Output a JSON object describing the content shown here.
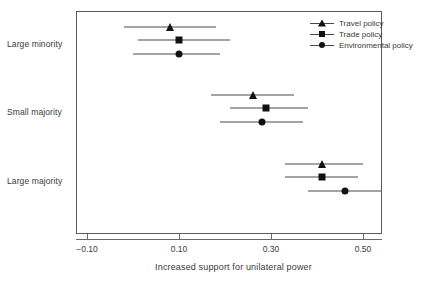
{
  "chart_data": {
    "type": "scatter",
    "subtype": "dot-and-whisker coefficient plot",
    "title": "",
    "xlabel": "Increased support for unilateral power",
    "ylabel": "",
    "xlim": [
      -0.155,
      0.511
    ],
    "xticks": [
      -0.1,
      0.1,
      0.3,
      0.5
    ],
    "xtick_labels": [
      "−0.10",
      "0.10",
      "0.30",
      "0.50"
    ],
    "categories": [
      "Large minority",
      "Small majority",
      "Large majority"
    ],
    "grid": false,
    "legend_position": "top-right",
    "error_bar_style": "horizontal confidence interval",
    "series": [
      {
        "name": "Travel policy",
        "marker": "triangle",
        "color": "#111111",
        "estimates": [
          0.08,
          0.26,
          0.41
        ],
        "ci_low": [
          -0.02,
          0.17,
          0.33
        ],
        "ci_high": [
          0.18,
          0.35,
          0.5
        ]
      },
      {
        "name": "Trade policy",
        "marker": "square",
        "color": "#111111",
        "estimates": [
          0.1,
          0.29,
          0.41
        ],
        "ci_low": [
          0.01,
          0.21,
          0.33
        ],
        "ci_high": [
          0.21,
          0.38,
          0.49
        ]
      },
      {
        "name": "Environmental policy",
        "marker": "circle",
        "color": "#111111",
        "estimates": [
          0.1,
          0.28,
          0.46
        ],
        "ci_low": [
          0.0,
          0.19,
          0.38
        ],
        "ci_high": [
          0.19,
          0.37,
          0.54
        ]
      }
    ]
  },
  "legend": {
    "items": [
      {
        "label": "Travel policy",
        "marker": "triangle"
      },
      {
        "label": "Trade policy",
        "marker": "square"
      },
      {
        "label": "Environmental policy",
        "marker": "circle"
      }
    ]
  },
  "axis": {
    "x_title": "Increased support for unilateral power",
    "tick_labels": [
      "−0.10",
      "0.10",
      "0.30",
      "0.50"
    ],
    "category_labels": [
      "Large minority",
      "Small majority",
      "Large majority"
    ]
  }
}
